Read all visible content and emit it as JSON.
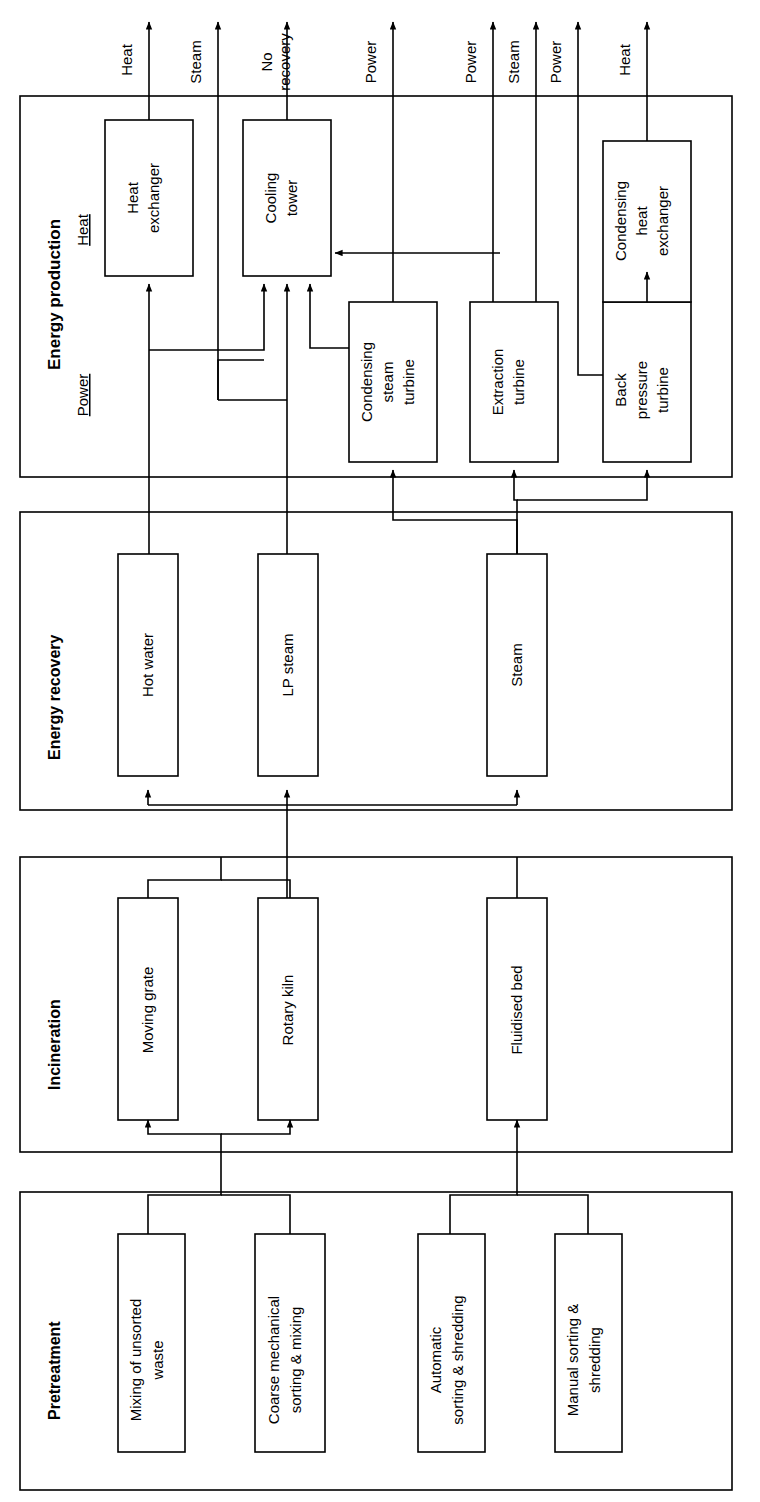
{
  "diagram": {
    "orientation": "rotated-90",
    "colors": {
      "stroke": "#000000",
      "fill": "#ffffff",
      "background": "#ffffff"
    },
    "sections": [
      {
        "id": "energy-production",
        "label": "Energy production",
        "sublabels": [
          {
            "id": "heat",
            "label": "Heat"
          },
          {
            "id": "power",
            "label": "Power"
          }
        ]
      },
      {
        "id": "energy-recovery",
        "label": "Energy recovery",
        "sublabels": []
      },
      {
        "id": "incineration",
        "label": "Incineration",
        "sublabels": []
      },
      {
        "id": "pretreatment",
        "label": "Pretreatment",
        "sublabels": []
      }
    ],
    "outputs": [
      {
        "id": "out-heat-1",
        "label": "Heat"
      },
      {
        "id": "out-steam-1",
        "label": "Steam"
      },
      {
        "id": "out-norecovery",
        "label": "No recovery"
      },
      {
        "id": "out-power-1",
        "label": "Power"
      },
      {
        "id": "out-power-2",
        "label": "Power"
      },
      {
        "id": "out-steam-2",
        "label": "Steam"
      },
      {
        "id": "out-power-3",
        "label": "Power"
      },
      {
        "id": "out-heat-2",
        "label": "Heat"
      }
    ],
    "boxes": {
      "energy_production": [
        {
          "id": "heat-exchanger",
          "label": "Heat exchanger"
        },
        {
          "id": "cooling-tower",
          "label": "Cooling tower"
        },
        {
          "id": "condensing-steam-turbine",
          "label": "Condensing steam turbine"
        },
        {
          "id": "extraction-turbine",
          "label": "Extraction turbine"
        },
        {
          "id": "condensing-heat-exchanger",
          "label": "Condensing heat exchanger"
        },
        {
          "id": "back-pressure-turbine",
          "label": "Back pressure turbine"
        }
      ],
      "energy_recovery": [
        {
          "id": "hot-water",
          "label": "Hot water"
        },
        {
          "id": "lp-steam",
          "label": "LP steam"
        },
        {
          "id": "steam",
          "label": "Steam"
        }
      ],
      "incineration": [
        {
          "id": "moving-grate",
          "label": "Moving grate"
        },
        {
          "id": "rotary-kiln",
          "label": "Rotary kiln"
        },
        {
          "id": "fluidised-bed",
          "label": "Fluidised bed"
        }
      ],
      "pretreatment": [
        {
          "id": "mixing-of-unsorted-waste",
          "label": "Mixing of unsorted waste"
        },
        {
          "id": "coarse-mechanical-sorting-mixing",
          "label": "Coarse mechanical sorting & mixing"
        },
        {
          "id": "automatic-sorting-shredding",
          "label": "Automatic sorting & shredding"
        },
        {
          "id": "manual-sorting-shredding",
          "label": "Manual sorting & shredding"
        }
      ]
    }
  }
}
